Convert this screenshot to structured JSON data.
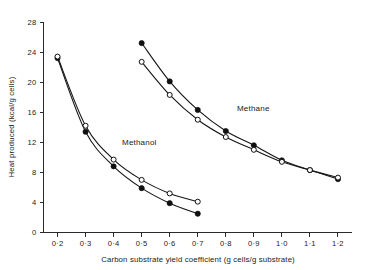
{
  "chart_data": {
    "type": "line",
    "title": "",
    "xlabel": "Carbon substrate yield coefficient (g cells/g substrate)",
    "ylabel": "Heat produced (kcal/g cells)",
    "xlim": [
      0.15,
      1.25
    ],
    "ylim": [
      0,
      28
    ],
    "grid": false,
    "legend_position": "inline-annotation",
    "xticks": [
      0.2,
      0.3,
      0.4,
      0.5,
      0.6,
      0.7,
      0.8,
      0.9,
      1.0,
      1.1,
      1.2
    ],
    "xtick_labels": [
      "0·2",
      "0·3",
      "0·4",
      "0·5",
      "0·6",
      "0·7",
      "0·8",
      "0·9",
      "1·0",
      "1·1",
      "1·2"
    ],
    "yticks": [
      0,
      4,
      8,
      12,
      16,
      20,
      24,
      28
    ],
    "ytick_labels": [
      "0",
      "4",
      "8",
      "12",
      "16",
      "20",
      "24",
      "28"
    ],
    "annotations": [
      {
        "text": "Methanol",
        "x": 0.43,
        "y": 11.6
      },
      {
        "text": "Methane",
        "x": 0.84,
        "y": 16.2
      }
    ],
    "series": [
      {
        "name": "Methanol (filled circles)",
        "group": "Methanol",
        "marker": "filled-circle",
        "x": [
          0.2,
          0.3,
          0.4,
          0.5,
          0.6,
          0.7
        ],
        "values": [
          23.2,
          13.4,
          8.8,
          5.9,
          3.9,
          2.5
        ]
      },
      {
        "name": "Methanol (open circles)",
        "group": "Methanol",
        "marker": "open-circle",
        "x": [
          0.2,
          0.3,
          0.4,
          0.5,
          0.6,
          0.7
        ],
        "values": [
          23.4,
          14.2,
          9.7,
          7.0,
          5.2,
          4.1
        ]
      },
      {
        "name": "Methane (filled circles)",
        "group": "Methane",
        "marker": "filled-circle",
        "x": [
          0.5,
          0.6,
          0.7,
          0.8,
          0.9,
          1.0,
          1.1,
          1.2
        ],
        "values": [
          25.2,
          20.1,
          16.3,
          13.5,
          11.6,
          9.6,
          8.3,
          7.1
        ]
      },
      {
        "name": "Methane (open circles)",
        "group": "Methane",
        "marker": "open-circle",
        "x": [
          0.5,
          0.6,
          0.7,
          0.8,
          0.9,
          1.0,
          1.1,
          1.2
        ],
        "values": [
          22.7,
          18.3,
          15.0,
          12.7,
          11.0,
          9.4,
          8.3,
          7.3
        ]
      }
    ]
  }
}
